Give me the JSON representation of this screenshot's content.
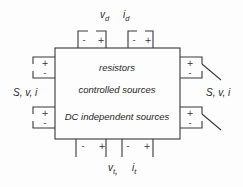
{
  "diagram": {
    "title_semantic": "linear-network-two-port-box",
    "box_contents": {
      "line1": "resistors",
      "line2": "controlled sources",
      "line3": "DC independent sources"
    },
    "labels": {
      "top_voltage": {
        "base": "v",
        "sub": "d"
      },
      "top_current": {
        "base": "i",
        "sub": "d"
      },
      "bottom_voltage": {
        "base": "v",
        "sub": "t"
      },
      "bottom_separator": ",",
      "bottom_current": {
        "base": "i",
        "sub": "t"
      },
      "left_terminals": "S, v, i",
      "right_terminals": "S, v, i"
    },
    "polarity": {
      "plus": "+",
      "minus": "-"
    },
    "colors": {
      "line": "#383838",
      "text": "#262626",
      "background": "#fdfdfd"
    }
  }
}
